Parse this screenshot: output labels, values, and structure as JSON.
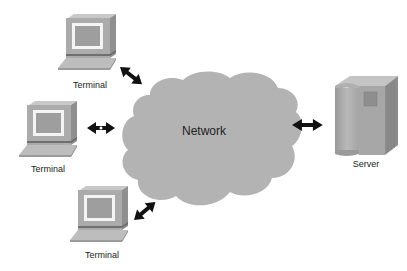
{
  "diagram": {
    "type": "network-topology",
    "center": {
      "id": "network",
      "label": "Network",
      "shape": "cloud"
    },
    "nodes": [
      {
        "id": "terminal-top",
        "label": "Terminal",
        "type": "terminal"
      },
      {
        "id": "terminal-middle",
        "label": "Terminal",
        "type": "terminal"
      },
      {
        "id": "terminal-bottom",
        "label": "Terminal",
        "type": "terminal"
      },
      {
        "id": "server",
        "label": "Server",
        "type": "server"
      }
    ],
    "edges": [
      {
        "from": "terminal-top",
        "to": "network",
        "style": "bidirectional-arrow"
      },
      {
        "from": "terminal-middle",
        "to": "network",
        "style": "bidirectional-arrow"
      },
      {
        "from": "terminal-bottom",
        "to": "network",
        "style": "bidirectional-arrow"
      },
      {
        "from": "network",
        "to": "server",
        "style": "bidirectional-arrow"
      }
    ],
    "colors": {
      "cloud_fill": "#b3b3b3",
      "device_body": "#a8a8a8",
      "device_dark": "#8a8a8a",
      "screen_frame": "#f2f2f2",
      "screen": "#9c9c9c",
      "arrow": "#111111"
    }
  }
}
